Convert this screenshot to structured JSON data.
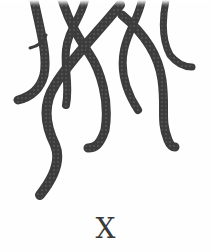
{
  "illustration": {
    "subject": "octopus-tentacles",
    "stroke_color": "#3c3c3c",
    "sucker_color": "#555555",
    "background": "#fefefe"
  },
  "caption": {
    "letter": "X"
  }
}
